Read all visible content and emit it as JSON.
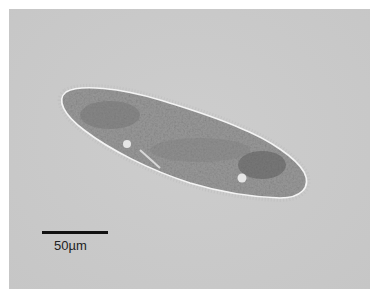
{
  "image": {
    "subject": "paramecium micrograph",
    "background_color": "#c9c9c9",
    "border_color": "#ffffff"
  },
  "scale_bar": {
    "label": "50µm",
    "color": "#111111"
  }
}
